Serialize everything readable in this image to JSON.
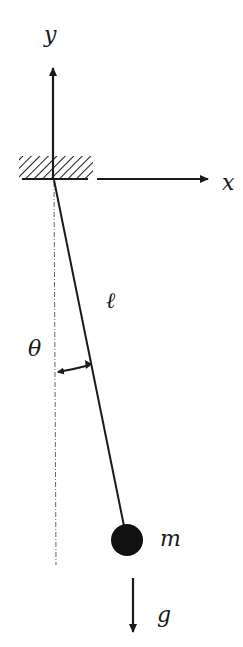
{
  "diagram": {
    "labels": {
      "y_axis": "y",
      "x_axis": "x",
      "length": "ℓ",
      "angle": "θ",
      "mass": "m",
      "gravity": "g"
    },
    "colors": {
      "stroke": "#1a1a1a",
      "background": "#ffffff",
      "reference_line": "#555555"
    },
    "geometry": {
      "pivot": [
        53,
        179
      ],
      "bob_center": [
        127,
        540
      ],
      "bob_radius": 16,
      "support_box": [
        19,
        156,
        74,
        23
      ],
      "gravity_arrow": [
        133,
        578,
        133,
        638
      ]
    }
  }
}
